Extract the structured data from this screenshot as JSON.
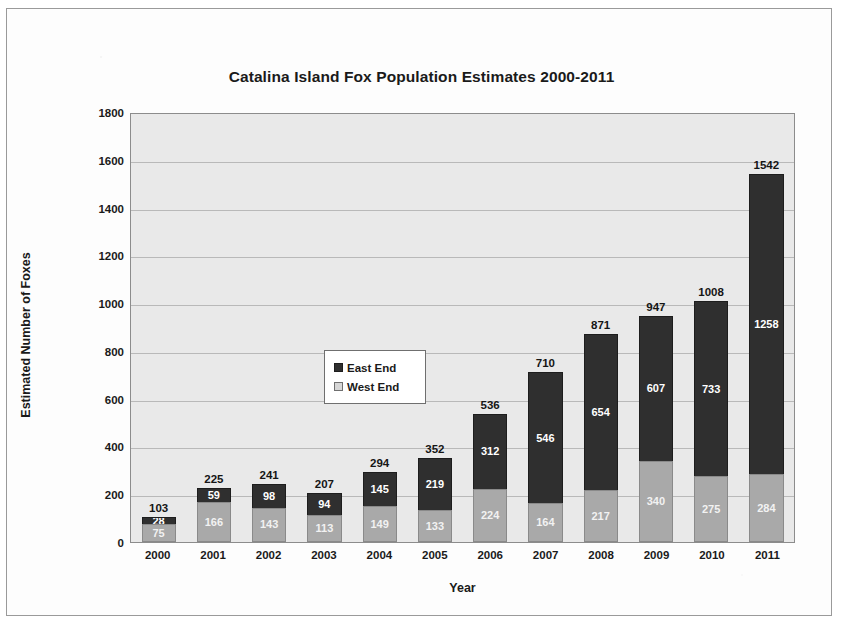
{
  "figure": {
    "y_axis_title": "Estimated Number of Foxes",
    "x_axis_title": "Year"
  },
  "legend": {
    "position": "inside-upper-left",
    "items": [
      {
        "label": "East End",
        "color": "#2f2f2f",
        "swatch": "east-end-swatch"
      },
      {
        "label": "West End",
        "color": "#a9a9a9",
        "swatch": "west-end-swatch"
      }
    ]
  },
  "chart_data": {
    "type": "bar",
    "subtype": "stacked-column",
    "title": "Catalina Island Fox Population Estimates 2000-2011",
    "xlabel": "Year",
    "ylabel": "Estimated Number of Foxes",
    "categories": [
      "2000",
      "2001",
      "2002",
      "2003",
      "2004",
      "2005",
      "2006",
      "2007",
      "2008",
      "2009",
      "2010",
      "2011"
    ],
    "series": [
      {
        "name": "West End",
        "color": "#a9a9a9",
        "values": [
          75,
          166,
          143,
          113,
          149,
          133,
          224,
          164,
          217,
          340,
          275,
          284
        ]
      },
      {
        "name": "East End",
        "color": "#2f2f2f",
        "values": [
          28,
          59,
          98,
          94,
          145,
          219,
          312,
          546,
          654,
          607,
          733,
          1258
        ]
      }
    ],
    "totals": [
      103,
      225,
      241,
      207,
      294,
      352,
      536,
      710,
      871,
      947,
      1008,
      1542
    ],
    "ylim": [
      0,
      1800
    ],
    "yticks": [
      0,
      200,
      400,
      600,
      800,
      1000,
      1200,
      1400,
      1600,
      1800
    ],
    "ytick_labels": [
      "0",
      "200",
      "400",
      "600",
      "800",
      "1000",
      "1200",
      "1400",
      "1600",
      "1800"
    ],
    "grid": "horizontal",
    "legend_position": "inside-upper-left",
    "plot_background": "#e9e9e9"
  }
}
